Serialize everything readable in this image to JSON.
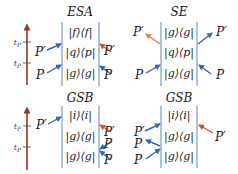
{
  "colors": {
    "background": "#ffffff",
    "axis": "#8a3a2a",
    "box_line": "#9bb4d6",
    "blue_arrow": "#3b63b5",
    "red_arrow": "#c0553a",
    "orange_arrow": "#d8843c",
    "text": "#1a1a1a"
  },
  "panels": [
    {
      "id": "top-left",
      "title": "ESA",
      "box": {
        "x1": 62,
        "x2": 99,
        "y1": 22,
        "y2": 86
      },
      "title_pos": {
        "x": 80,
        "y": 16
      },
      "rows": [
        {
          "text": "|f⟩⟨f|",
          "y": 36
        },
        {
          "text": "|q⟩⟨p|",
          "y": 56
        },
        {
          "text": "|g⟩⟨g|",
          "y": 77
        }
      ],
      "axis": {
        "x": 27,
        "y1": 85,
        "y2": 24,
        "ticks": [
          {
            "y": 42,
            "label": "tP"
          },
          {
            "y": 63,
            "label": "tP"
          }
        ]
      },
      "labels": [
        {
          "text": "P′",
          "x": 35,
          "y": 56
        },
        {
          "text": "P",
          "x": 36,
          "y": 79
        },
        {
          "text": "P′",
          "x": 104,
          "y": 55
        },
        {
          "text": "P",
          "x": 104,
          "y": 79
        }
      ],
      "arrows": [
        {
          "x1": 47,
          "y1": 50,
          "x2": 61,
          "y2": 44,
          "color": "blue"
        },
        {
          "x1": 47,
          "y1": 73,
          "x2": 61,
          "y2": 65,
          "color": "blue"
        },
        {
          "x1": 111,
          "y1": 52,
          "x2": 100,
          "y2": 44,
          "color": "red"
        },
        {
          "x1": 111,
          "y1": 74,
          "x2": 100,
          "y2": 66,
          "color": "blue"
        }
      ]
    },
    {
      "id": "top-right",
      "title": "SE",
      "box": {
        "x1": 161,
        "x2": 197,
        "y1": 22,
        "y2": 86
      },
      "title_pos": {
        "x": 179,
        "y": 16
      },
      "rows": [
        {
          "text": "|g⟩⟨g|",
          "y": 36
        },
        {
          "text": "|q⟩⟨p|",
          "y": 56
        },
        {
          "text": "|g⟩⟨g|",
          "y": 77
        }
      ],
      "labels": [
        {
          "text": "P′",
          "x": 133,
          "y": 36
        },
        {
          "text": "P",
          "x": 135,
          "y": 79
        },
        {
          "text": "P′",
          "x": 216,
          "y": 36
        },
        {
          "text": "P",
          "x": 216,
          "y": 79
        }
      ],
      "arrows": [
        {
          "x1": 160,
          "y1": 44,
          "x2": 146,
          "y2": 34,
          "color": "orange"
        },
        {
          "x1": 146,
          "y1": 73,
          "x2": 160,
          "y2": 65,
          "color": "blue"
        },
        {
          "x1": 198,
          "y1": 44,
          "x2": 212,
          "y2": 33,
          "color": "blue"
        },
        {
          "x1": 211,
          "y1": 74,
          "x2": 199,
          "y2": 65,
          "color": "blue"
        }
      ]
    },
    {
      "id": "bottom-left",
      "title": "GSB",
      "box": {
        "x1": 62,
        "x2": 99,
        "y1": 106,
        "y2": 168
      },
      "title_pos": {
        "x": 80,
        "y": 102
      },
      "rows": [
        {
          "text": "|i⟩⟨i|",
          "y": 119
        },
        {
          "text": "|g⟩⟨g|",
          "y": 140
        },
        {
          "text": "|g⟩⟨g|",
          "y": 160
        }
      ],
      "axis": {
        "x": 27,
        "y1": 170,
        "y2": 107,
        "ticks": [
          {
            "y": 126,
            "label": "tP"
          },
          {
            "y": 147,
            "label": "tP"
          }
        ]
      },
      "labels": [
        {
          "text": "P′",
          "x": 36,
          "y": 129
        },
        {
          "text": "P′",
          "x": 104,
          "y": 136
        },
        {
          "text": "P",
          "x": 104,
          "y": 148
        },
        {
          "text": "P",
          "x": 104,
          "y": 164
        }
      ],
      "arrows": [
        {
          "x1": 48,
          "y1": 124,
          "x2": 61,
          "y2": 117,
          "color": "blue"
        },
        {
          "x1": 111,
          "y1": 132,
          "x2": 100,
          "y2": 125,
          "color": "red"
        },
        {
          "x1": 111,
          "y1": 142,
          "x2": 100,
          "y2": 149,
          "color": "blue"
        },
        {
          "x1": 111,
          "y1": 160,
          "x2": 100,
          "y2": 151,
          "color": "blue"
        }
      ]
    },
    {
      "id": "bottom-right",
      "title": "GSB",
      "box": {
        "x1": 161,
        "x2": 197,
        "y1": 106,
        "y2": 168
      },
      "title_pos": {
        "x": 179,
        "y": 102
      },
      "rows": [
        {
          "text": "|i⟩⟨i|",
          "y": 119
        },
        {
          "text": "|g⟩⟨g|",
          "y": 140
        },
        {
          "text": "|g⟩⟨g|",
          "y": 160
        }
      ],
      "labels": [
        {
          "text": "P′",
          "x": 134,
          "y": 136
        },
        {
          "text": "P",
          "x": 134,
          "y": 148
        },
        {
          "text": "P",
          "x": 134,
          "y": 164
        },
        {
          "text": "P′",
          "x": 215,
          "y": 141
        }
      ],
      "arrows": [
        {
          "x1": 145,
          "y1": 131,
          "x2": 160,
          "y2": 124,
          "color": "blue"
        },
        {
          "x1": 160,
          "y1": 146,
          "x2": 146,
          "y2": 140,
          "color": "blue"
        },
        {
          "x1": 146,
          "y1": 159,
          "x2": 160,
          "y2": 149,
          "color": "blue"
        },
        {
          "x1": 213,
          "y1": 133,
          "x2": 199,
          "y2": 125,
          "color": "red"
        }
      ]
    }
  ]
}
